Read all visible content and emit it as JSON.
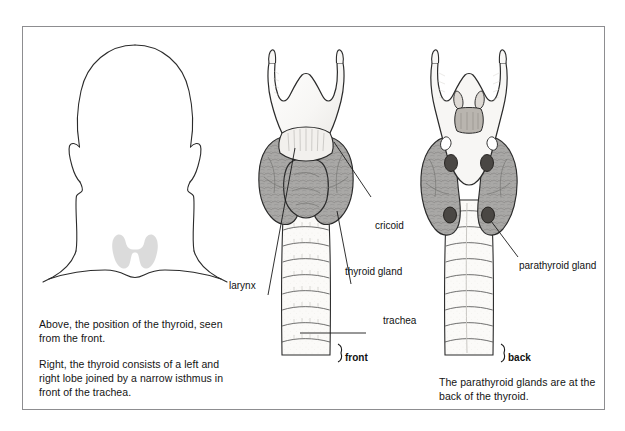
{
  "figure": {
    "title_present": false,
    "panels": [
      {
        "id": "head-front-silhouette",
        "name": "head-and-neck-silhouette",
        "description": "Outline of a head, neck and shoulders seen from the front with the butterfly-shaped thyroid shaded in the lower neck"
      },
      {
        "id": "thyroid-front-view",
        "name": "thyroid-front-view",
        "orientation_label": "front",
        "description": "Larynx with thyroid gland wrapped around it and the trachea descending below"
      },
      {
        "id": "thyroid-back-view",
        "name": "thyroid-back-view",
        "orientation_label": "back",
        "description": "Posterior view of the larynx and thyroid showing four parathyroid glands"
      }
    ]
  },
  "labels": {
    "larynx": "larynx",
    "cricoid": "cricoid",
    "thyroid_gland": "thyroid gland",
    "trachea": "trachea",
    "parathyroid_gland": "parathyroid gland",
    "front": "front",
    "back": "back"
  },
  "captions": {
    "left_top": "Above, the position of the thyroid, seen from the front.",
    "left_bottom": "Right, the thyroid consists of a left and right lobe joined by a narrow isthmus in front of the trachea.",
    "right_bottom": "The parathyroid glands are at the back of the thyroid."
  },
  "colors": {
    "frame_border": "#8d8d90",
    "page_background": "#ffffff",
    "outline_stroke": "#2b2b2b",
    "thyroid_gland_fill": "#a9a8a6",
    "larynx_fill": "#f6f5f3",
    "trachea_fill": "#fbfaf8",
    "parathyroid_fill": "#4a4744",
    "silhouette_thyroid_fill": "#d9d9d9",
    "leader_line": "#1a1a1a",
    "text": "#141414"
  }
}
